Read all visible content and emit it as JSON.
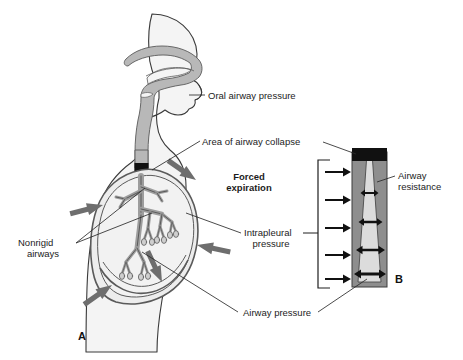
{
  "figure": {
    "background": "#ffffff",
    "panels": [
      {
        "id": "A",
        "letter": "A",
        "description": "Sagittal view of head, neck and thorax showing upper airway, bronchial tree, pleura and diaphragm during forced expiration"
      },
      {
        "id": "B",
        "letter": "B",
        "description": "Magnified segment of collapsed airway shown as a tapering tube with external compressing pressure"
      }
    ]
  },
  "labels": {
    "oral_airway_pressure": "Oral airway pressure",
    "area_of_airway_collapse": "Area of airway collapse",
    "forced_expiration_line1": "Forced",
    "forced_expiration_line2": "expiration",
    "intrapleural_pressure_line1": "Intrapleural",
    "intrapleural_pressure_line2": "pressure",
    "nonrigid_airways_line1": "Nonrigid",
    "nonrigid_airways_line2": "airways",
    "airway_pressure": "Airway pressure",
    "airway_resistance_line1": "Airway",
    "airway_resistance_line2": "resistance",
    "panel_a_letter": "A",
    "panel_b_letter": "B"
  },
  "icons": {
    "forced_expiration_arrow": "thick-inward-arrow-icon",
    "pressure_arrow": "right-arrow-icon",
    "resistance_arrow": "double-headed-arrow-icon",
    "leader_line": "leader-line-icon",
    "bracket": "bracket-icon"
  },
  "colors": {
    "outline": "#333333",
    "body_fill": "#f2f2f2",
    "airway_gray": "#b3b3b3",
    "lumen_light": "#d9d9d9",
    "collapse_black": "#111111",
    "arrow_gray": "#737373",
    "tube_wall": "#8c8c8c",
    "text": "#1c1c1c"
  },
  "counts": {
    "intrapleural_arrows_panel_b": 5,
    "resistance_arrows_panel_b": 4,
    "forced_expiration_arrows_panel_a": 5
  }
}
